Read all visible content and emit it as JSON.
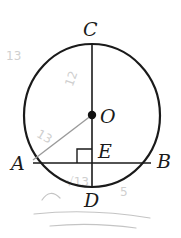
{
  "diagram": {
    "type": "geometry",
    "points": {
      "C": "C",
      "O": "O",
      "A": "A",
      "B": "B",
      "E": "E",
      "D": "D"
    },
    "relations": [
      "CD is a diameter",
      "CD ⊥ AB at E",
      "O is the center"
    ],
    "right_angle_at": "E",
    "colors": {
      "stroke": "#1a1a1a",
      "pencil": "#c4c4c4"
    },
    "pencil_annotations": [
      "13",
      "12",
      "13",
      "5",
      "√13"
    ]
  }
}
